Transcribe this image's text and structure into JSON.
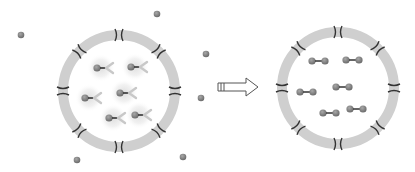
{
  "diagram": {
    "colors": {
      "background": "#ffffff",
      "ring": "#cfcfcf",
      "channel": "#333333",
      "ligand": "#8a8a8a",
      "ligand_dark": "#6e6e6e",
      "receptor": "#c8c8c8",
      "halo": "#e6e6e6",
      "arrow_stroke": "#555555",
      "arrow_fill": "#ffffff"
    },
    "before": {
      "label": "",
      "cell": {
        "cx": 119,
        "cy": 91,
        "r": 56,
        "ring_width": 10
      },
      "channels_count": 8,
      "receptor_complexes": [
        {
          "x": 97,
          "y": 68
        },
        {
          "x": 131,
          "y": 67
        },
        {
          "x": 85,
          "y": 98
        },
        {
          "x": 120,
          "y": 93
        },
        {
          "x": 109,
          "y": 118
        },
        {
          "x": 135,
          "y": 115
        }
      ],
      "free_ligands": [
        {
          "x": 21,
          "y": 35
        },
        {
          "x": 157,
          "y": 14
        },
        {
          "x": 206,
          "y": 54
        },
        {
          "x": 201,
          "y": 98
        },
        {
          "x": 77,
          "y": 160
        },
        {
          "x": 183,
          "y": 157
        }
      ]
    },
    "arrow": {
      "direction": "right",
      "x": 218,
      "y": 78,
      "width": 40,
      "height": 18
    },
    "after": {
      "label": "",
      "cell": {
        "cx": 338,
        "cy": 88,
        "r": 56,
        "ring_width": 10
      },
      "channels_count": 8,
      "dimers": [
        {
          "x": 312,
          "y": 61
        },
        {
          "x": 346,
          "y": 60
        },
        {
          "x": 300,
          "y": 92
        },
        {
          "x": 336,
          "y": 87
        },
        {
          "x": 323,
          "y": 113
        },
        {
          "x": 350,
          "y": 109
        }
      ]
    }
  }
}
